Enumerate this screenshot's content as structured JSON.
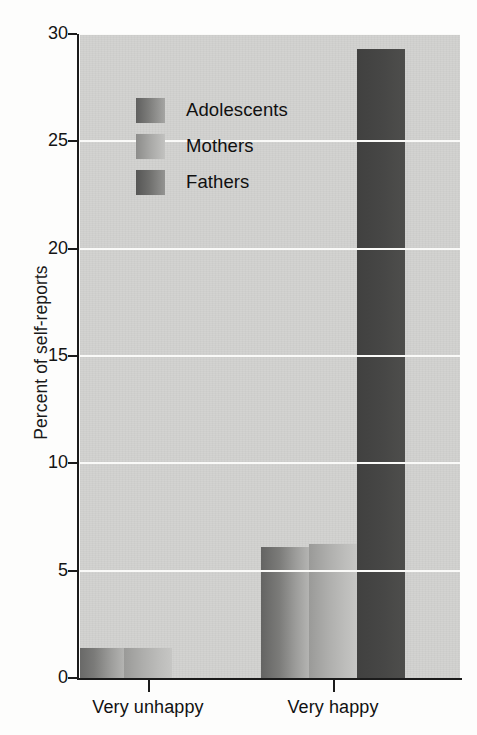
{
  "chart_data": {
    "type": "bar",
    "title": "",
    "subtitle": "",
    "xlabel": "",
    "ylabel": "Percent of self-reports",
    "categories": [
      "Very unhappy",
      "Very happy"
    ],
    "series": [
      {
        "name": "Adolescents",
        "values": [
          1.4,
          6.1
        ],
        "color": "#7b7b79"
      },
      {
        "name": "Mothers",
        "values": [
          1.4,
          6.25
        ],
        "color": "#aeaeac"
      },
      {
        "name": "Fathers",
        "values": [
          3.4,
          29.3
        ],
        "color": "#4c4c4b"
      }
    ],
    "ylim": [
      0,
      30
    ],
    "yticks": [
      0,
      5,
      10,
      15,
      20,
      25,
      30
    ],
    "ytick_labels": [
      "0",
      "5",
      "10",
      "15",
      "20",
      "25",
      "30"
    ],
    "grid": true,
    "grid_color": "#fafaf8",
    "plot_background": "#d2d2d0",
    "legend_position": "upper-left-inside",
    "legend_entries": [
      "Adolescents",
      "Mothers",
      "Fathers"
    ]
  },
  "axes": {
    "y_title": "Percent of self-reports"
  }
}
